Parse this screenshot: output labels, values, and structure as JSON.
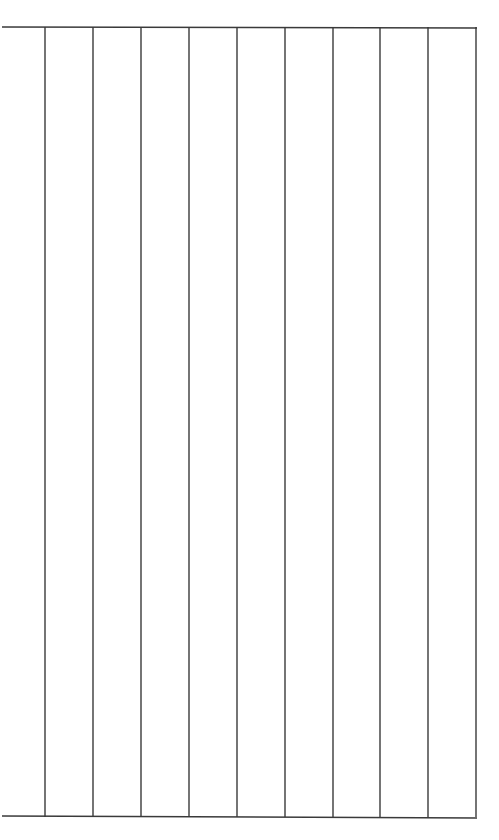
{
  "grid": {
    "line_color": "#3a3a3a",
    "line_width": 1.4,
    "top_line": {
      "x1": 2,
      "y1": 27,
      "x2": 477,
      "y2": 28
    },
    "bottom_line": {
      "x1": 2,
      "y1": 816,
      "x2": 477,
      "y2": 818
    },
    "vertical_lines_x": [
      45,
      93,
      141,
      189,
      237,
      285,
      333,
      380,
      428,
      476
    ],
    "vertical_top_y": 27,
    "vertical_bottom_y": 817,
    "column_count": 10
  }
}
